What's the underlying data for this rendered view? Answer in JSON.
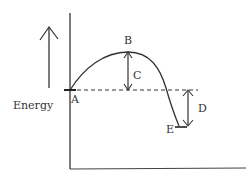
{
  "diagram": {
    "type": "energy-profile",
    "y_axis_label": "Energy",
    "points": {
      "A": "A",
      "B": "B",
      "E": "E"
    },
    "intervals": {
      "C": "C",
      "D": "D"
    },
    "colors": {
      "line": "#333333",
      "background": "#ffffff"
    }
  }
}
